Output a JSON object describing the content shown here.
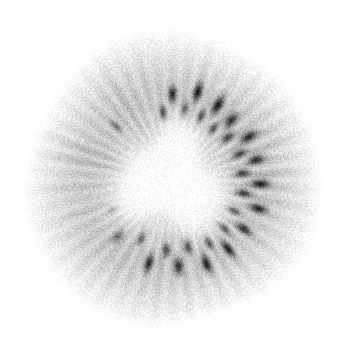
{
  "image": {
    "subject": "kiwi-fruit-cross-section",
    "title": "Kiwifruit transverse slice",
    "rendering": "grayscale",
    "width": 345,
    "height": 348,
    "background_color": "#ffffff",
    "grain": {
      "enabled": true,
      "amount": 0.3,
      "description": "heavy monochrome film grain over the whole fruit"
    }
  },
  "fruit": {
    "name": "kiwi-slice",
    "center": {
      "x": 172,
      "y": 180
    },
    "radius_x": 145,
    "radius_y": 150,
    "rotation_deg": -6,
    "outline_wobble": 0.045,
    "rim_color": "#fbfbfb",
    "flesh_color_outer": "#f2f2f2",
    "flesh_color_mid": "#dcdcdc",
    "flesh_color_inner": "#c2c2c2"
  },
  "core": {
    "name": "white-pith-core",
    "center": {
      "x": 170,
      "y": 181
    },
    "radius_x": 52,
    "radius_y": 50,
    "color": "#ffffff",
    "shape": "irregular rounded triangle",
    "glow_radius": 72
  },
  "seed_ring": {
    "name": "seed-ring",
    "count": 30,
    "inner_radius": 56,
    "outer_radius": 96,
    "seed_color_dark": "#3c3c3c",
    "seed_color_mid": "#585858",
    "seeds": [
      {
        "angle_deg": 268,
        "radius": 68,
        "len": 13,
        "wid": 7,
        "dark": 0.78
      },
      {
        "angle_deg": 276,
        "radius": 86,
        "len": 15,
        "wid": 8,
        "dark": 0.82
      },
      {
        "angle_deg": 286,
        "radius": 72,
        "len": 14,
        "wid": 7,
        "dark": 0.7
      },
      {
        "angle_deg": 292,
        "radius": 92,
        "len": 16,
        "wid": 8,
        "dark": 0.88
      },
      {
        "angle_deg": 300,
        "radius": 70,
        "len": 13,
        "wid": 7,
        "dark": 0.74
      },
      {
        "angle_deg": 307,
        "radius": 88,
        "len": 17,
        "wid": 9,
        "dark": 0.9
      },
      {
        "angle_deg": 314,
        "radius": 66,
        "len": 12,
        "wid": 7,
        "dark": 0.66
      },
      {
        "angle_deg": 320,
        "radius": 84,
        "len": 15,
        "wid": 8,
        "dark": 0.84
      },
      {
        "angle_deg": 328,
        "radius": 70,
        "len": 14,
        "wid": 7,
        "dark": 0.76
      },
      {
        "angle_deg": 336,
        "radius": 88,
        "len": 16,
        "wid": 8,
        "dark": 0.86
      },
      {
        "angle_deg": 344,
        "radius": 72,
        "len": 13,
        "wid": 7,
        "dark": 0.72
      },
      {
        "angle_deg": 352,
        "radius": 86,
        "len": 15,
        "wid": 8,
        "dark": 0.84
      },
      {
        "angle_deg": 0,
        "radius": 70,
        "len": 13,
        "wid": 7,
        "dark": 0.78
      },
      {
        "angle_deg": 8,
        "radius": 88,
        "len": 16,
        "wid": 8,
        "dark": 0.88
      },
      {
        "angle_deg": 16,
        "radius": 72,
        "len": 14,
        "wid": 7,
        "dark": 0.8
      },
      {
        "angle_deg": 24,
        "radius": 90,
        "len": 16,
        "wid": 8,
        "dark": 0.86
      },
      {
        "angle_deg": 32,
        "radius": 68,
        "len": 13,
        "wid": 7,
        "dark": 0.72
      },
      {
        "angle_deg": 40,
        "radius": 86,
        "len": 15,
        "wid": 8,
        "dark": 0.82
      },
      {
        "angle_deg": 49,
        "radius": 70,
        "len": 14,
        "wid": 7,
        "dark": 0.76
      },
      {
        "angle_deg": 57,
        "radius": 88,
        "len": 16,
        "wid": 8,
        "dark": 0.86
      },
      {
        "angle_deg": 66,
        "radius": 72,
        "len": 13,
        "wid": 7,
        "dark": 0.74
      },
      {
        "angle_deg": 74,
        "radius": 90,
        "len": 16,
        "wid": 8,
        "dark": 0.88
      },
      {
        "angle_deg": 83,
        "radius": 68,
        "len": 13,
        "wid": 7,
        "dark": 0.78
      },
      {
        "angle_deg": 92,
        "radius": 86,
        "len": 15,
        "wid": 8,
        "dark": 0.84
      },
      {
        "angle_deg": 101,
        "radius": 70,
        "len": 13,
        "wid": 7,
        "dark": 0.72
      },
      {
        "angle_deg": 112,
        "radius": 86,
        "len": 15,
        "wid": 8,
        "dark": 0.8
      },
      {
        "angle_deg": 124,
        "radius": 66,
        "len": 12,
        "wid": 6,
        "dark": 0.62
      },
      {
        "angle_deg": 140,
        "radius": 78,
        "len": 13,
        "wid": 7,
        "dark": 0.58
      },
      {
        "angle_deg": 160,
        "radius": 66,
        "len": 12,
        "wid": 6,
        "dark": 0.42
      },
      {
        "angle_deg": 230,
        "radius": 78,
        "len": 12,
        "wid": 6,
        "dark": 0.46
      }
    ]
  },
  "rays": {
    "name": "radial-locule-streaks",
    "count": 46,
    "inner_radius": 44,
    "outer_radius": 128,
    "color": "#9a9a9a",
    "max_opacity": 0.55
  },
  "accessibility": {
    "alt_text": "Grayscale close-up photograph of a kiwifruit sliced across, showing the bright white central core, a ring of dark seeds, and radiating pale streaks in the flesh, on a white background.",
    "caption": "Kiwifruit transverse slice"
  }
}
